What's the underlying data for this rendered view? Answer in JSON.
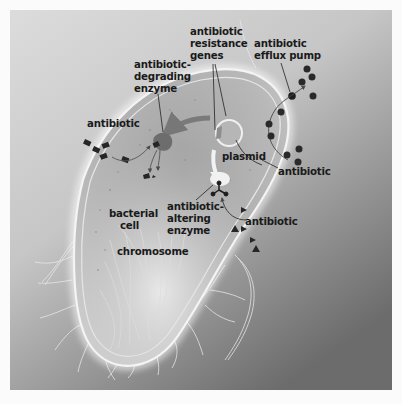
{
  "diagram": {
    "style": "grayscale illustration",
    "labels": {
      "resistance_genes": [
        "antibiotic",
        "resistance",
        "genes"
      ],
      "efflux_pump": [
        "antibiotic",
        "efflux pump"
      ],
      "degrading_enzyme": [
        "antibiotic-",
        "degrading",
        "enzyme"
      ],
      "antibiotic_left": "antibiotic",
      "antibiotic_right": "antibiotic",
      "antibiotic_lower": "antibiotic",
      "plasmid": "plasmid",
      "altering_enzyme": [
        "antibiotic-",
        "altering",
        "enzyme"
      ],
      "bacterial_cell": [
        "bacterial",
        "cell"
      ],
      "chromosome": "chromosome"
    },
    "elements": {
      "antibiotic_diamonds_count": 5,
      "antibiotic_circles_outside_top": 4,
      "antibiotic_circles_inside": 4,
      "antibiotic_circles_outside_bottom": 3,
      "antibiotic_triangles_count": 5
    },
    "colors": {
      "background": "#fbfbfb",
      "frame_light": "#d6d6d6",
      "frame_dark": "#7a7a7a",
      "cell_body": "#a9a9a9",
      "cell_membrane": "#f2f2f2",
      "antibiotic_marker": "#2a2a2a",
      "enzyme": "#6a6a6a"
    }
  }
}
